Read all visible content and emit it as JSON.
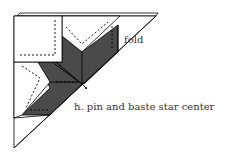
{
  "diagram": {
    "type": "quilting instruction diagram",
    "labels": {
      "fold": "fold",
      "step": "h. pin and baste star center"
    },
    "colors": {
      "dark_fabric": "#4a4a4a",
      "light_fabric": "#ffffff",
      "line": "#000000"
    }
  }
}
